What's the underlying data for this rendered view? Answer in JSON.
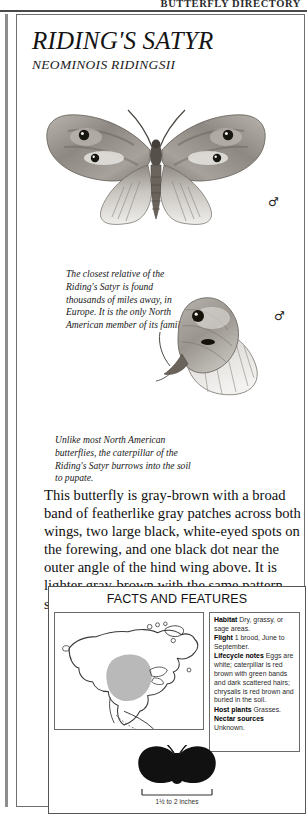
{
  "running_head": "BUTTERFLY DIRECTORY",
  "title": {
    "common_name": "RIDING'S SATYR",
    "latin_name": "NEOMINOIS RIDINGSII"
  },
  "plates": [
    {
      "name": "dorsal-view",
      "sex_symbol": "♂",
      "alt": "Riding's Satyr wings-open dorsal view, gray-brown with feather-like gray band and black white-eyed spots"
    },
    {
      "name": "ventral-view",
      "sex_symbol": "♂",
      "alt": "Riding's Satyr wings-closed ventral view showing mottled gray-brown underside with two black eyespots"
    }
  ],
  "captions": [
    "The closest relative of the Riding's Satyr is found thousands of miles away, in Europe. It is the only North American member of its family.",
    "Unlike most North American butterflies, the caterpillar of the Riding's Satyr burrows into the soil to pupate."
  ],
  "body_text": "This butterfly is gray-brown with a broad band of featherlike gray patches across both wings, two large black, white-eyed spots on the forewing, and one black dot near the outer angle of the hind wing above. It is lighter gray-brown with the same pattern showing through below.",
  "facts": {
    "title": "FACTS AND FEATURES",
    "map": {
      "name": "north-america-range-map",
      "range_color": "#b9b9b9",
      "outline_color": "#3a3a3a",
      "region_description": "Central and western North America"
    },
    "entries": [
      {
        "label": "Habitat",
        "value": "Dry, grassy, or sage areas."
      },
      {
        "label": "Flight",
        "value": "1 brood, June to September."
      },
      {
        "label": "Lifecycle notes",
        "value": "Eggs are white; caterpillar is red brown with green bands and dark scattered hairs; chrysalis is red brown and buried in the soil."
      },
      {
        "label": "Host plants",
        "value": "Grasses."
      },
      {
        "label": "Nectar sources",
        "value": "Unknown."
      }
    ],
    "size": {
      "caption": "1½ to 2 inches",
      "silhouette_color": "#111111"
    }
  }
}
